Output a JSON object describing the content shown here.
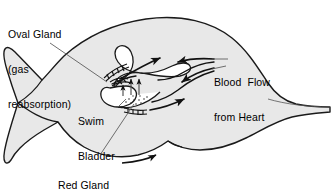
{
  "diagram": {
    "colors": {
      "body_fill": "#e8e8e8",
      "outline": "#1a1a1a",
      "text": "#000000",
      "leader_line": "#555555",
      "background": "#ffffff"
    },
    "labels": {
      "oval_gland": {
        "line1": "Oval Gland",
        "line2": "(gas",
        "line3": "reabsorption)"
      },
      "blood_flow": {
        "line1": "Blood  Flow",
        "line2": "from Heart"
      },
      "swim_bladder": {
        "line1": "Swim",
        "line2": "Bladder"
      },
      "red_gland": {
        "line1": "Red Gland",
        "line2": "(gas secretion)"
      }
    }
  }
}
